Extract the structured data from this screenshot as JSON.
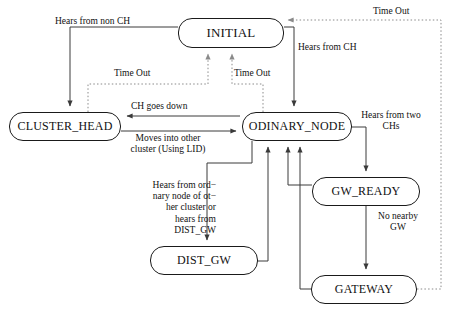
{
  "diagram": {
    "colors": {
      "node_stroke": "#1a1a1a",
      "solid_edge": "#3a3a3a",
      "dotted_edge": "#8a8a8a",
      "text": "#111111",
      "background": "#ffffff"
    },
    "states": [
      {
        "id": "initial",
        "label": "INITIAL",
        "x": 178,
        "y": 18,
        "w": 106,
        "h": 30,
        "font_size": 13
      },
      {
        "id": "cluster_head",
        "label": "CLUSTER_HEAD",
        "x": 9,
        "y": 112,
        "w": 112,
        "h": 29,
        "font_size": 12
      },
      {
        "id": "odinary_node",
        "label": "ODINARY_NODE",
        "x": 242,
        "y": 112,
        "w": 110,
        "h": 29,
        "font_size": 12
      },
      {
        "id": "gw_ready",
        "label": "GW_READY",
        "x": 312,
        "y": 177,
        "w": 108,
        "h": 29,
        "font_size": 12
      },
      {
        "id": "dist_gw",
        "label": "DIST_GW",
        "x": 150,
        "y": 246,
        "w": 108,
        "h": 29,
        "font_size": 12
      },
      {
        "id": "gateway",
        "label": "GATEWAY",
        "x": 311,
        "y": 275,
        "w": 106,
        "h": 29,
        "font_size": 12
      }
    ],
    "edge_labels": [
      {
        "id": "hears-from-non-ch",
        "text": "Hears from non CH",
        "x": 55,
        "y": 16,
        "w": 130,
        "align": "left",
        "font_size": 9.5
      },
      {
        "id": "time-out-top-right",
        "text": "Time Out",
        "x": 373,
        "y": 6,
        "w": 60,
        "align": "left",
        "font_size": 9.5
      },
      {
        "id": "hears-from-ch",
        "text": "Hears from CH",
        "x": 298,
        "y": 42,
        "w": 85,
        "align": "left",
        "font_size": 9.5
      },
      {
        "id": "time-out-left",
        "text": "Time Out",
        "x": 114,
        "y": 68,
        "w": 52,
        "align": "left",
        "font_size": 9.5
      },
      {
        "id": "time-out-mid",
        "text": "Time Out",
        "x": 234,
        "y": 68,
        "w": 52,
        "align": "left",
        "font_size": 9.5
      },
      {
        "id": "ch-goes-down",
        "text": "CH goes down",
        "x": 131,
        "y": 101,
        "w": 90,
        "align": "left",
        "font_size": 9.5
      },
      {
        "id": "hears-from-two-chs",
        "text": "Hears from two\nCHs",
        "x": 352,
        "y": 110,
        "w": 78,
        "align": "center",
        "font_size": 9.5
      },
      {
        "id": "moves-into-other",
        "text": "Moves into other\ncluster  (Using LID)",
        "x": 112,
        "y": 133,
        "w": 112,
        "align": "center",
        "font_size": 9.5
      },
      {
        "id": "hears-from-ordinary",
        "text": "Hears from ord−\nnary node of ot−\nher cluster or\nhears from\nDIST_GW",
        "x": 140,
        "y": 180,
        "w": 76,
        "align": "right",
        "font_size": 9.5
      },
      {
        "id": "no-nearby-gw",
        "text": "No nearby\nGW",
        "x": 370,
        "y": 211,
        "w": 56,
        "align": "center",
        "font_size": 9.5
      }
    ],
    "transitions": [
      {
        "id": "initial-to-cluster-head",
        "from": "INITIAL",
        "to": "CLUSTER_HEAD",
        "label": "Hears from non CH",
        "style": "solid"
      },
      {
        "id": "initial-to-odinary",
        "from": "INITIAL",
        "to": "ODINARY_NODE",
        "label": "Hears from CH",
        "style": "solid"
      },
      {
        "id": "cluster-head-to-initial",
        "from": "CLUSTER_HEAD",
        "to": "INITIAL",
        "label": "Time Out",
        "style": "dotted"
      },
      {
        "id": "odinary-to-initial",
        "from": "ODINARY_NODE",
        "to": "INITIAL",
        "label": "Time Out",
        "style": "dotted"
      },
      {
        "id": "gateway-to-initial",
        "from": "GATEWAY",
        "to": "INITIAL",
        "label": "Time Out",
        "style": "dotted"
      },
      {
        "id": "odinary-to-cluster-head",
        "from": "ODINARY_NODE",
        "to": "CLUSTER_HEAD",
        "label": "CH goes down",
        "style": "solid"
      },
      {
        "id": "cluster-head-to-odinary",
        "from": "CLUSTER_HEAD",
        "to": "ODINARY_NODE",
        "label": "Moves into other cluster  (Using LID)",
        "style": "solid"
      },
      {
        "id": "odinary-to-gw-ready",
        "from": "ODINARY_NODE",
        "to": "GW_READY",
        "label": "Hears from two CHs",
        "style": "solid"
      },
      {
        "id": "gw-ready-to-gateway",
        "from": "GW_READY",
        "to": "GATEWAY",
        "label": "No nearby GW",
        "style": "solid"
      },
      {
        "id": "gw-ready-to-odinary",
        "from": "GW_READY",
        "to": "ODINARY_NODE",
        "label": "",
        "style": "solid"
      },
      {
        "id": "gateway-to-odinary",
        "from": "GATEWAY",
        "to": "ODINARY_NODE",
        "label": "",
        "style": "solid"
      },
      {
        "id": "odinary-to-dist-gw",
        "from": "ODINARY_NODE",
        "to": "DIST_GW",
        "label": "Hears from ord−nary node of ot−her cluster or hears from DIST_GW",
        "style": "solid"
      },
      {
        "id": "dist-gw-to-odinary",
        "from": "DIST_GW",
        "to": "ODINARY_NODE",
        "label": "",
        "style": "solid"
      }
    ]
  }
}
